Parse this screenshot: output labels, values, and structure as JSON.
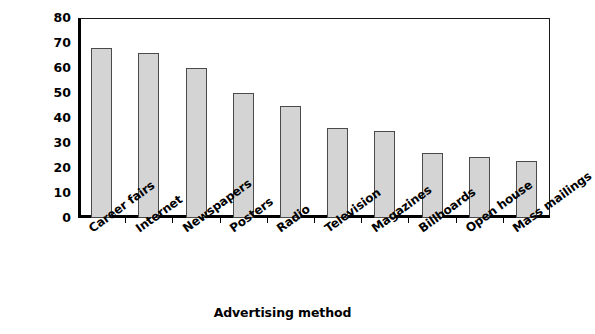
{
  "chart_data": {
    "type": "bar",
    "title": "",
    "xlabel": "Advertising method",
    "ylabel": "Number of agencies",
    "categories": [
      "Career fairs",
      "Internet",
      "Newspapers",
      "Posters",
      "Radio",
      "Television",
      "Magazines",
      "Billboards",
      "Open house",
      "Mass mailings"
    ],
    "values": [
      68,
      66,
      60,
      50,
      45,
      36,
      35,
      26,
      24.5,
      23
    ],
    "ylim": [
      0,
      80
    ],
    "yticks": [
      0,
      10,
      20,
      30,
      40,
      50,
      60,
      70,
      80
    ],
    "ytick_labels": [
      "0",
      "10",
      "20",
      "30",
      "40",
      "50",
      "60",
      "70",
      "80"
    ],
    "grid": false,
    "legend": false,
    "legend_position": "none",
    "bar_fill_color": "#d4d4d4",
    "bar_border_color": "#4a4a4a",
    "axis_color": "#000000",
    "background_color": "#ffffff"
  },
  "axes": {
    "y_title": "Number of agencies",
    "x_title": "Advertising method"
  }
}
